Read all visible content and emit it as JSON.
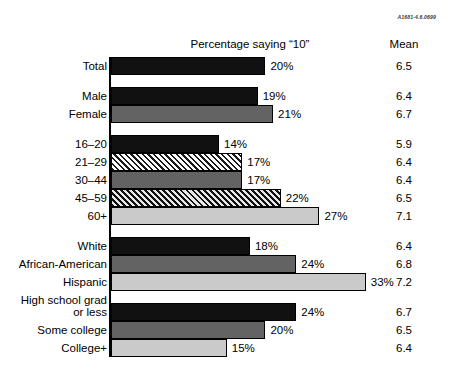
{
  "source_code": "A1681-4.6.0699",
  "header": {
    "percentage_label": "Percentage saying “10”",
    "mean_label": "Mean"
  },
  "chart_data": {
    "type": "bar",
    "title": "Percentage saying “10”",
    "subtitle": "",
    "xlabel": "",
    "ylabel": "",
    "orientation": "horizontal",
    "xlim": [
      0,
      35
    ],
    "grid": false,
    "legend": "none",
    "value_suffix": "%",
    "extra_column": "Mean",
    "categories": [
      "Total",
      "Male",
      "Female",
      "16–20",
      "21–29",
      "30–44",
      "45–59",
      "60+",
      "White",
      "African-American",
      "Hispanic",
      "High school grad or less",
      "Some college",
      "College+"
    ],
    "values": [
      20,
      19,
      21,
      14,
      17,
      17,
      22,
      27,
      18,
      24,
      33,
      24,
      20,
      15
    ],
    "means": [
      6.5,
      6.4,
      6.7,
      5.9,
      6.4,
      6.4,
      6.5,
      7.1,
      6.4,
      6.8,
      7.2,
      6.7,
      6.5,
      6.4
    ]
  },
  "rows": [
    {
      "label": "Total",
      "label_line1": "Total",
      "label_line2": "",
      "value": 20,
      "value_text": "20%",
      "mean_text": "6.5",
      "fill": "black",
      "group_start": false
    },
    {
      "label": "Male",
      "label_line1": "Male",
      "label_line2": "",
      "value": 19,
      "value_text": "19%",
      "mean_text": "6.4",
      "fill": "black",
      "group_start": true
    },
    {
      "label": "Female",
      "label_line1": "Female",
      "label_line2": "",
      "value": 21,
      "value_text": "21%",
      "mean_text": "6.7",
      "fill": "darkgray",
      "group_start": false
    },
    {
      "label": "16–20",
      "label_line1": "16–20",
      "label_line2": "",
      "value": 14,
      "value_text": "14%",
      "mean_text": "5.9",
      "fill": "black",
      "group_start": true
    },
    {
      "label": "21–29",
      "label_line1": "21–29",
      "label_line2": "",
      "value": 17,
      "value_text": "17%",
      "mean_text": "6.4",
      "fill": "hatch-light",
      "group_start": false
    },
    {
      "label": "30–44",
      "label_line1": "30–44",
      "label_line2": "",
      "value": 17,
      "value_text": "17%",
      "mean_text": "6.4",
      "fill": "darkgray",
      "group_start": false
    },
    {
      "label": "45–59",
      "label_line1": "45–59",
      "label_line2": "",
      "value": 22,
      "value_text": "22%",
      "mean_text": "6.5",
      "fill": "hatch-dark",
      "group_start": false
    },
    {
      "label": "60+",
      "label_line1": "60+",
      "label_line2": "",
      "value": 27,
      "value_text": "27%",
      "mean_text": "7.1",
      "fill": "lightgray",
      "group_start": false
    },
    {
      "label": "White",
      "label_line1": "White",
      "label_line2": "",
      "value": 18,
      "value_text": "18%",
      "mean_text": "6.4",
      "fill": "black",
      "group_start": true
    },
    {
      "label": "African-American",
      "label_line1": "African-American",
      "label_line2": "",
      "value": 24,
      "value_text": "24%",
      "mean_text": "6.8",
      "fill": "darkgray",
      "group_start": false
    },
    {
      "label": "Hispanic",
      "label_line1": "Hispanic",
      "label_line2": "",
      "value": 33,
      "value_text": "33%",
      "mean_text": "7.2",
      "fill": "lightgray",
      "group_start": false
    },
    {
      "label": "High school grad or less",
      "label_line1": "High school grad",
      "label_line2": "or less",
      "value": 24,
      "value_text": "24%",
      "mean_text": "6.7",
      "fill": "black",
      "group_start": true
    },
    {
      "label": "Some college",
      "label_line1": "Some college",
      "label_line2": "",
      "value": 20,
      "value_text": "20%",
      "mean_text": "6.5",
      "fill": "darkgray",
      "group_start": false
    },
    {
      "label": "College+",
      "label_line1": "College+",
      "label_line2": "",
      "value": 15,
      "value_text": "15%",
      "mean_text": "6.4",
      "fill": "lightgray",
      "group_start": false
    }
  ],
  "scale": {
    "px_per_percent": 7.72,
    "axis_x": 109
  }
}
